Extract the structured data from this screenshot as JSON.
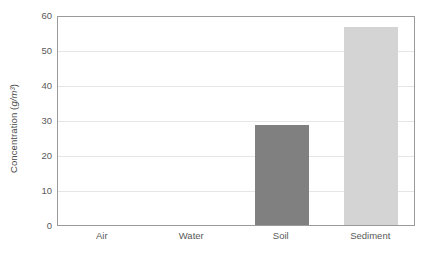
{
  "chart_data": {
    "type": "bar",
    "title": "",
    "xlabel": "",
    "ylabel": "Concentration (g/m³)",
    "ylabel_text": "Concentration (",
    "ylabel_units": "g/m³",
    "ylabel_close": ")",
    "categories": [
      "Air",
      "Water",
      "Soil",
      "Sediment"
    ],
    "values": [
      0,
      0,
      29,
      57
    ],
    "ylim": [
      0,
      60
    ],
    "ytick_step": 10,
    "yticks": [
      0,
      10,
      20,
      30,
      40,
      50,
      60
    ],
    "ytick_labels": [
      "0",
      "10",
      "20",
      "30",
      "40",
      "50",
      "60"
    ],
    "grid": true,
    "grid_axis": "y",
    "legend": false,
    "legend_position": "none",
    "bar_colors": [
      "#808080",
      "#808080",
      "#808080",
      "#d4d4d4"
    ],
    "colors": {
      "plot_border": "#9a9a9a",
      "gridline": "#e6e6e6",
      "tick_text": "#5a5a5a",
      "axis_title_text": "#4a4a4a",
      "background": "#ffffff",
      "bar_dark": "#808080",
      "bar_light": "#d4d4d4"
    }
  }
}
